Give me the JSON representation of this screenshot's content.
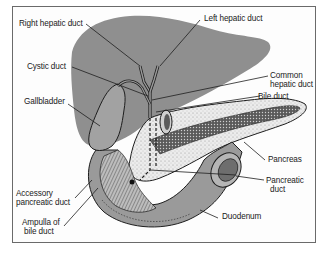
{
  "figure": {
    "colors": {
      "liver": "#8f8f8f",
      "pancreas": "#e6e6e6",
      "duodenum": "#9a9a9a",
      "outline": "#1e1e1e",
      "frame": "#6a6a6a",
      "text": "#1a1a1a"
    }
  },
  "labels": {
    "right_hepatic_duct": "Right hepatic duct",
    "left_hepatic_duct": "Left hepatic duct",
    "cystic_duct": "Cystic duct",
    "common_hepatic_duct_1": "Common",
    "common_hepatic_duct_2": "hepatic duct",
    "gallbladder": "Gallbladder",
    "bile_duct": "Bile duct",
    "pancreas": "Pancreas",
    "pancreatic_duct_1": "Pancreatic",
    "pancreatic_duct_2": "duct",
    "accessory_pancreatic_duct_1": "Accessory",
    "accessory_pancreatic_duct_2": "pancreatic duct",
    "ampulla_1": "Ampulla of",
    "ampulla_2": "bile duct",
    "duodenum": "Duodenum"
  }
}
